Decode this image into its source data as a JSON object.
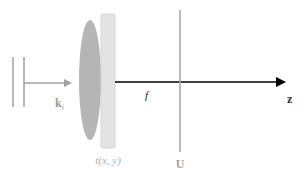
{
  "diagram": {
    "colors": {
      "grey": "#a8a8a8",
      "lens": "#b5b5b5",
      "plate": "#e3e3e3",
      "plate_border": "#cfcfcf",
      "axis": "#000000",
      "label_grey": "#9a9a9a"
    },
    "labels": {
      "wavevector_main": "k",
      "wavevector_sub": "i",
      "transparency": "t(x, y)",
      "focal_length": "f",
      "output_plane": "U",
      "axis": "z"
    }
  }
}
